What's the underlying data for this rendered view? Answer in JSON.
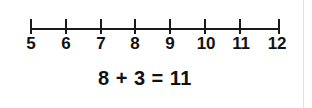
{
  "background_color": "#ffffff",
  "ink_color": "#1a1a1a",
  "edge_rule_color": "#e2e2e2",
  "number_line": {
    "name": "number-line",
    "start": 5,
    "end": 12,
    "step": 1,
    "tick_count": 8,
    "labels": [
      "5",
      "6",
      "7",
      "8",
      "9",
      "10",
      "11",
      "12"
    ],
    "tick_positions_px": [
      30,
      65,
      100,
      134,
      169,
      204,
      239,
      278
    ],
    "axis_y_px": 28
  },
  "equation": {
    "text": "8 + 3 = 11",
    "addend_1": "8",
    "operator": "+",
    "addend_2": "3",
    "equals": "=",
    "sum": "11"
  }
}
